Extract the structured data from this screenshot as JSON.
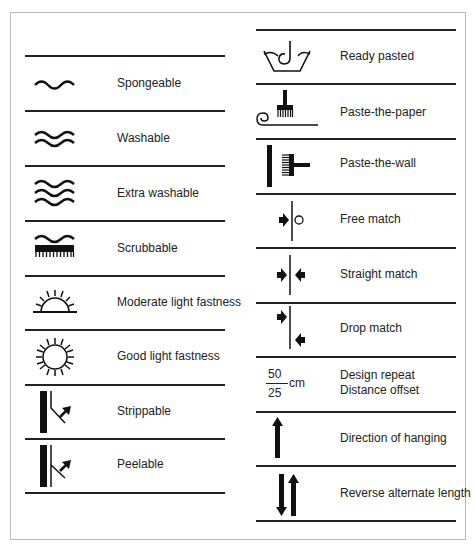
{
  "colors": {
    "ink": "#1a1a1a",
    "border": "#b9b9b9",
    "background": "#ffffff"
  },
  "left_column": [
    {
      "icon": "spongeable-wave-icon",
      "label": "Spongeable"
    },
    {
      "icon": "washable-double-wave-icon",
      "label": "Washable"
    },
    {
      "icon": "extra-washable-triple-wave-icon",
      "label": "Extra washable"
    },
    {
      "icon": "scrubbable-brush-wave-icon",
      "label": "Scrubbable"
    },
    {
      "icon": "half-sun-icon",
      "label": "Moderate light fastness"
    },
    {
      "icon": "full-sun-icon",
      "label": "Good light fastness"
    },
    {
      "icon": "strippable-icon",
      "label": "Strippable"
    },
    {
      "icon": "peelable-icon",
      "label": "Peelable"
    }
  ],
  "right_column": [
    {
      "icon": "ready-pasted-basin-icon",
      "label": "Ready pasted"
    },
    {
      "icon": "paste-the-paper-brush-icon",
      "label": "Paste-the-paper"
    },
    {
      "icon": "paste-the-wall-brush-icon",
      "label": "Paste-the-wall"
    },
    {
      "icon": "free-match-icon",
      "label": "Free match"
    },
    {
      "icon": "straight-match-icon",
      "label": "Straight match"
    },
    {
      "icon": "drop-match-icon",
      "label": "Drop match"
    },
    {
      "icon": "design-repeat-fraction-icon",
      "label": "Design repeat",
      "label2": "Distance offset",
      "fraction": {
        "numerator": "50",
        "denominator": "25",
        "unit": "cm"
      }
    },
    {
      "icon": "direction-arrow-up-icon",
      "label": "Direction of  hanging"
    },
    {
      "icon": "reverse-alternate-arrows-icon",
      "label": "Reverse alternate length"
    }
  ]
}
